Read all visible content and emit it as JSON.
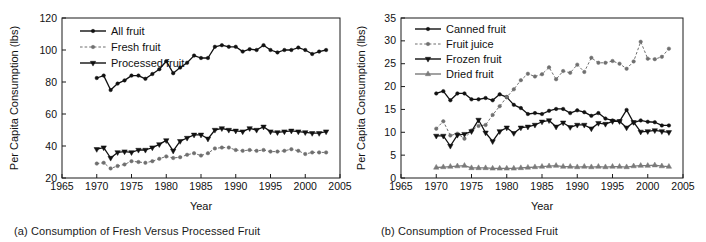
{
  "figure": {
    "panel_a_caption": "(a) Consumption of Fresh Versus Processed Fruit",
    "panel_b_caption": "(b) Consumption of Processed Fruit"
  },
  "chart_data": [
    {
      "type": "line",
      "panel": "a",
      "title": "(a) Consumption of Fresh Versus Processed Fruit",
      "xlabel": "Year",
      "ylabel": "Per Capita Consumption (lbs)",
      "xlim": [
        1965,
        2005
      ],
      "ylim": [
        20,
        120
      ],
      "xticks": [
        1965,
        1970,
        1975,
        1980,
        1985,
        1990,
        1995,
        2000,
        2005
      ],
      "yticks": [
        20,
        40,
        60,
        80,
        100,
        120
      ],
      "ytick_labels": [
        "20",
        "40",
        "60",
        "80",
        "100",
        "120"
      ],
      "grid": false,
      "legend_position": "top-left",
      "x": [
        1970,
        1971,
        1972,
        1973,
        1974,
        1975,
        1976,
        1977,
        1978,
        1979,
        1980,
        1981,
        1982,
        1983,
        1984,
        1985,
        1986,
        1987,
        1988,
        1989,
        1990,
        1991,
        1992,
        1993,
        1994,
        1995,
        1996,
        1997,
        1998,
        1999,
        2000,
        2001,
        2002,
        2003
      ],
      "series": [
        {
          "name": "All fruit",
          "marker": "circle",
          "line": "solid",
          "color": "#111111",
          "values": [
            82.5,
            84.0,
            75.0,
            79.0,
            81.0,
            84.0,
            84.0,
            82.0,
            85.0,
            88.0,
            93.0,
            85.5,
            89.0,
            92.0,
            96.5,
            95.0,
            95.0,
            102.0,
            103.0,
            102.0,
            102.0,
            99.0,
            100.5,
            100.0,
            103.0,
            100.0,
            98.5,
            100.0,
            100.0,
            101.5,
            100.0,
            97.5,
            99.0,
            100.0
          ]
        },
        {
          "name": "Fresh fruit",
          "marker": "circle",
          "line": "dashed",
          "color": "#6f6f6f",
          "values": [
            29.0,
            29.5,
            26.0,
            27.5,
            28.5,
            30.5,
            30.0,
            29.5,
            30.5,
            32.0,
            33.5,
            32.5,
            33.0,
            34.5,
            35.5,
            34.0,
            35.5,
            38.5,
            39.0,
            39.0,
            37.5,
            37.0,
            37.5,
            37.0,
            37.5,
            36.5,
            36.5,
            37.0,
            38.0,
            37.0,
            35.0,
            36.0,
            36.0,
            36.0
          ]
        },
        {
          "name": "Processed fruit",
          "marker": "triangle-down",
          "line": "solid",
          "color": "#111111",
          "values": [
            38.0,
            39.0,
            32.5,
            36.0,
            36.5,
            36.0,
            37.5,
            37.5,
            39.0,
            41.0,
            43.5,
            37.0,
            43.0,
            45.0,
            47.0,
            47.0,
            44.5,
            50.0,
            51.0,
            50.0,
            49.5,
            49.0,
            51.0,
            50.0,
            52.0,
            49.0,
            48.5,
            49.0,
            49.5,
            49.0,
            48.5,
            48.0,
            48.0,
            49.0
          ]
        }
      ]
    },
    {
      "type": "line",
      "panel": "b",
      "title": "(b) Consumption of Processed Fruit",
      "xlabel": "Year",
      "ylabel": "Per Capita Consumption (lbs)",
      "xlim": [
        1965,
        2005
      ],
      "ylim": [
        0,
        35
      ],
      "xticks": [
        1965,
        1970,
        1975,
        1980,
        1985,
        1990,
        1995,
        2000,
        2005
      ],
      "yticks": [
        0,
        5,
        10,
        15,
        20,
        25,
        30,
        35
      ],
      "ytick_labels": [
        "0",
        "5",
        "10",
        "15",
        "20",
        "25",
        "30",
        "35"
      ],
      "grid": false,
      "legend_position": "top-left",
      "x": [
        1970,
        1971,
        1972,
        1973,
        1974,
        1975,
        1976,
        1977,
        1978,
        1979,
        1980,
        1981,
        1982,
        1983,
        1984,
        1985,
        1986,
        1987,
        1988,
        1989,
        1990,
        1991,
        1992,
        1993,
        1994,
        1995,
        1996,
        1997,
        1998,
        1999,
        2000,
        2001,
        2002,
        2003
      ],
      "series": [
        {
          "name": "Canned fruit",
          "marker": "circle",
          "line": "solid",
          "color": "#111111",
          "values": [
            18.5,
            19.0,
            17.0,
            18.5,
            18.5,
            17.2,
            17.2,
            17.5,
            17.0,
            18.3,
            17.7,
            16.0,
            15.3,
            14.0,
            14.2,
            14.0,
            14.7,
            15.1,
            15.1,
            14.2,
            14.8,
            14.4,
            13.6,
            14.2,
            13.0,
            12.6,
            12.4,
            14.9,
            12.1,
            12.6,
            12.3,
            12.2,
            11.5,
            11.5
          ]
        },
        {
          "name": "Fruit juice",
          "marker": "circle",
          "line": "dashed",
          "color": "#6f6f6f",
          "values": [
            10.8,
            12.4,
            9.3,
            9.7,
            8.6,
            10.4,
            11.4,
            11.6,
            13.8,
            15.7,
            17.7,
            19.4,
            21.4,
            22.8,
            22.2,
            22.7,
            24.2,
            21.6,
            23.4,
            23.0,
            24.8,
            23.2,
            26.3,
            25.2,
            25.2,
            25.6,
            25.0,
            23.9,
            25.5,
            29.8,
            26.1,
            26.0,
            26.5,
            28.3
          ]
        },
        {
          "name": "Frozen fruit",
          "marker": "triangle-down",
          "line": "solid",
          "color": "#111111",
          "values": [
            9.2,
            9.2,
            7.0,
            9.4,
            9.6,
            10.2,
            12.7,
            9.9,
            8.0,
            10.2,
            11.0,
            9.8,
            11.0,
            11.2,
            11.6,
            12.3,
            12.6,
            11.2,
            12.1,
            11.1,
            11.6,
            11.6,
            10.8,
            12.0,
            11.8,
            12.4,
            12.4,
            11.0,
            12.2,
            10.1,
            10.2,
            10.4,
            10.2,
            10.0
          ]
        },
        {
          "name": "Dried fruit",
          "marker": "triangle-up",
          "line": "solid",
          "color": "#7a7a7a",
          "values": [
            2.3,
            2.4,
            2.5,
            2.6,
            2.7,
            2.2,
            2.2,
            2.2,
            2.1,
            2.1,
            2.1,
            2.1,
            2.2,
            2.3,
            2.4,
            2.5,
            2.6,
            2.7,
            2.5,
            2.5,
            2.4,
            2.5,
            2.4,
            2.5,
            2.4,
            2.5,
            2.5,
            2.4,
            2.6,
            2.7,
            2.7,
            2.8,
            2.6,
            2.5
          ]
        }
      ]
    }
  ]
}
